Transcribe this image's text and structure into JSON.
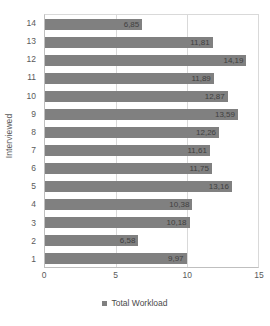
{
  "chart_data": {
    "type": "bar",
    "orientation": "horizontal",
    "title": "",
    "xlabel": "",
    "ylabel": "Interviewed",
    "xlim": [
      0,
      15
    ],
    "x_ticks": [
      "0",
      "5",
      "10",
      "15"
    ],
    "x_tick_values": [
      0,
      5,
      10,
      15
    ],
    "grid": true,
    "legend_position": "bottom",
    "categories": [
      "1",
      "2",
      "3",
      "4",
      "5",
      "6",
      "7",
      "8",
      "9",
      "10",
      "11",
      "12",
      "13",
      "14"
    ],
    "series": [
      {
        "name": "Total Workload",
        "color": "#808080",
        "values": [
          9.97,
          6.58,
          10.18,
          10.38,
          13.16,
          11.75,
          11.61,
          12.26,
          13.59,
          12.87,
          11.89,
          14.19,
          11.81,
          6.85
        ],
        "labels": [
          "9,97",
          "6,58",
          "10,18",
          "10,38",
          "13,16",
          "11,75",
          "11,61",
          "12,26",
          "13,59",
          "12,87",
          "11,89",
          "14,19",
          "11,81",
          "6,85"
        ]
      }
    ],
    "rows_top_to_bottom": [
      {
        "category": "14",
        "value": 6.85,
        "label": "6,85"
      },
      {
        "category": "13",
        "value": 11.81,
        "label": "11,81"
      },
      {
        "category": "12",
        "value": 14.19,
        "label": "14,19"
      },
      {
        "category": "11",
        "value": 11.89,
        "label": "11,89"
      },
      {
        "category": "10",
        "value": 12.87,
        "label": "12,87"
      },
      {
        "category": "9",
        "value": 13.59,
        "label": "13,59"
      },
      {
        "category": "8",
        "value": 12.26,
        "label": "12,26"
      },
      {
        "category": "7",
        "value": 11.61,
        "label": "11,61"
      },
      {
        "category": "6",
        "value": 11.75,
        "label": "11,75"
      },
      {
        "category": "5",
        "value": 13.16,
        "label": "13,16"
      },
      {
        "category": "4",
        "value": 10.38,
        "label": "10,38"
      },
      {
        "category": "3",
        "value": 10.18,
        "label": "10,18"
      },
      {
        "category": "2",
        "value": 6.58,
        "label": "6,58"
      },
      {
        "category": "1",
        "value": 9.97,
        "label": "9,97"
      }
    ]
  },
  "axes": {
    "y_title": "Interviewed",
    "y_tick_labels": [
      "14",
      "13",
      "12",
      "11",
      "10",
      "9",
      "8",
      "7",
      "6",
      "5",
      "4",
      "3",
      "2",
      "1"
    ],
    "x_tick_labels": [
      "0",
      "5",
      "10",
      "15"
    ]
  },
  "legend": {
    "entries": [
      {
        "label": "Total Workload",
        "color": "#808080",
        "marker": "square-swatch-icon"
      }
    ]
  },
  "colors": {
    "bar": "#808080",
    "gridline": "#d9d9d9",
    "axis": "#bfbfbf",
    "text": "#5a5a5a",
    "background": "#ffffff"
  }
}
